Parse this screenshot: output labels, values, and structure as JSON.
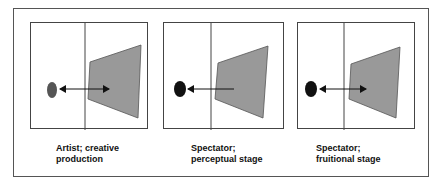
{
  "figure": {
    "panels": [
      {
        "id": "artist",
        "caption_line1": "Artist; creative",
        "caption_line2": "production",
        "ellipse_color": "#555555",
        "arrow": "bidirectional"
      },
      {
        "id": "spectator-perceptual",
        "caption_line1": "Spectator;",
        "caption_line2": "perceptual stage",
        "ellipse_color": "#111111",
        "arrow": "toward-viewer"
      },
      {
        "id": "spectator-fruitional",
        "caption_line1": "Spectator;",
        "caption_line2": "fruitional stage",
        "ellipse_color": "#111111",
        "arrow": "bidirectional"
      }
    ],
    "colors": {
      "trapezoid_fill": "#999999",
      "stroke": "#444444"
    }
  }
}
